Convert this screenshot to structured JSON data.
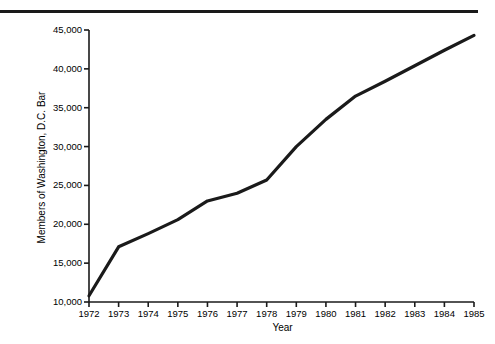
{
  "chart_data": {
    "type": "line",
    "title": "",
    "xlabel": "Year",
    "ylabel": "Members of Washington, D.C. Bar",
    "categories": [
      1972,
      1973,
      1974,
      1975,
      1976,
      1977,
      1978,
      1979,
      1980,
      1981,
      1982,
      1983,
      1984,
      1985
    ],
    "values": [
      10800,
      17100,
      18800,
      20600,
      23000,
      24000,
      25700,
      30000,
      33500,
      36500,
      38400,
      40400,
      42400,
      44300
    ],
    "x": [
      1972,
      1973,
      1974,
      1975,
      1976,
      1977,
      1978,
      1979,
      1980,
      1981,
      1982,
      1983,
      1984,
      1985
    ],
    "xtick_labels": [
      "1972",
      "1973",
      "1974",
      "1975",
      "1976",
      "1977",
      "1978",
      "1979",
      "1980",
      "1981",
      "1982",
      "1983",
      "1984",
      "1985"
    ],
    "ytick_labels": [
      "10,000",
      "15,000",
      "20,000",
      "25,000",
      "30,000",
      "35,000",
      "40,000",
      "45,000"
    ],
    "ytick_values": [
      10000,
      15000,
      20000,
      25000,
      30000,
      35000,
      40000,
      45000
    ],
    "xlim": [
      1972,
      1985
    ],
    "ylim": [
      10000,
      45000
    ],
    "grid": false,
    "legend": null,
    "legend_position": "none",
    "line_color": "#1a1a1a",
    "line_width": 3,
    "background_color": "#ffffff"
  },
  "decorations": {
    "top_rule_color": "#1a1a1a"
  }
}
